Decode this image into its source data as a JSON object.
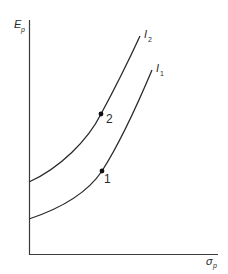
{
  "diagram": {
    "type": "indifference-curves",
    "y_axis": {
      "label": "E",
      "subscript": "p"
    },
    "x_axis": {
      "label": "σ",
      "subscript": "p"
    },
    "curves": [
      {
        "id": "I2",
        "label": "I",
        "subscript": "2"
      },
      {
        "id": "I1",
        "label": "I",
        "subscript": "1"
      }
    ],
    "points": [
      {
        "label": "2",
        "on_curve": "I2"
      },
      {
        "label": "1",
        "on_curve": "I1"
      }
    ],
    "colors": {
      "line": "#2a2a2a",
      "background": "#ffffff"
    }
  }
}
